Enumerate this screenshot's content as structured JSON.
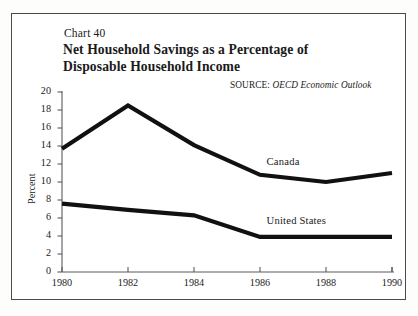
{
  "figure": {
    "chart_number": "Chart 40",
    "title_lines": [
      "Net Household Savings as a Percentage of",
      "Disposable Household Income"
    ],
    "source_label": "SOURCE:",
    "source_publication": "OECD Economic Outlook",
    "background_color": "#ffffff",
    "frame_color": "#4a4a4a",
    "line_color": "#111111",
    "axis_color": "#5a5a5a"
  },
  "chart_data": {
    "type": "line",
    "title": "Net Household Savings as a Percentage of Disposable Household Income",
    "subtitle": "Chart 40",
    "xlabel": "",
    "ylabel": "Percent",
    "x": [
      1980,
      1982,
      1984,
      1986,
      1988,
      1990
    ],
    "xtick_labels": [
      "1980",
      "1982",
      "1984",
      "1986",
      "1988",
      "1990"
    ],
    "ytick_labels": [
      "20",
      "18",
      "16",
      "14",
      "12",
      "10",
      "8",
      "6",
      "4",
      "2",
      "0"
    ],
    "yticks": [
      20,
      18,
      16,
      14,
      12,
      10,
      8,
      6,
      4,
      2,
      0
    ],
    "xlim": [
      1980,
      1990
    ],
    "ylim": [
      0,
      20
    ],
    "grid": false,
    "legend_position": "inline-labels",
    "series": [
      {
        "name": "Canada",
        "values": [
          13.7,
          18.5,
          14.1,
          10.8,
          10.0,
          11.0
        ],
        "label_x": 1986.2,
        "label_y": 12.1
      },
      {
        "name": "United States",
        "values": [
          7.6,
          6.9,
          6.3,
          3.9,
          3.9,
          3.9
        ],
        "label_x": 1986.2,
        "label_y": 5.6
      }
    ]
  }
}
